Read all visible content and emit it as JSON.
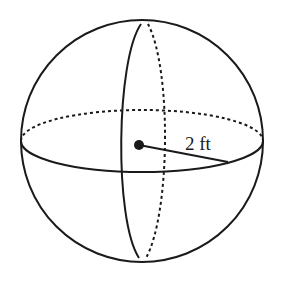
{
  "figure": {
    "type": "sphere",
    "radius_label": "2 ft",
    "stroke_color": "#1a1a1a",
    "background": "#ffffff"
  }
}
